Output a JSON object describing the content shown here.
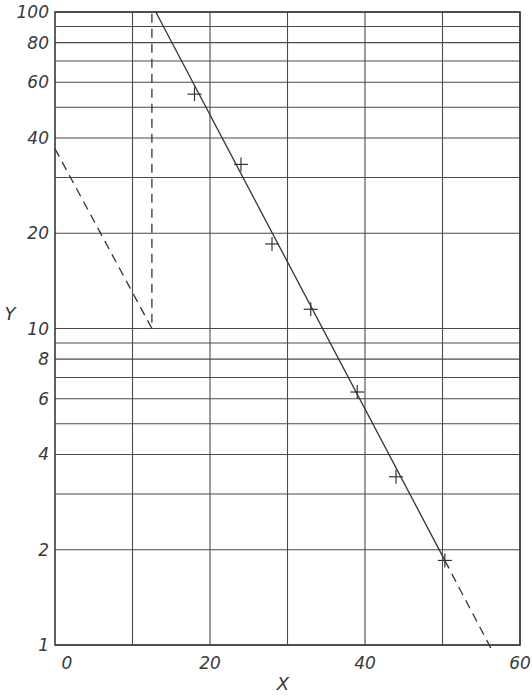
{
  "chart_data": {
    "type": "scatter",
    "title": "",
    "xlabel": "X",
    "ylabel": "Y",
    "xscale": "linear",
    "yscale": "log",
    "xlim": [
      0,
      60
    ],
    "ylim": [
      1,
      100
    ],
    "x_ticks": [
      0,
      20,
      40,
      60
    ],
    "y_ticks": [
      1,
      2,
      4,
      6,
      8,
      10,
      20,
      40,
      60,
      80,
      100
    ],
    "x_tick_labels": [
      "0",
      "20",
      "40",
      "60"
    ],
    "y_tick_labels": [
      "1",
      "2",
      "4",
      "6",
      "8",
      "10",
      "20",
      "40",
      "60",
      "80",
      "100"
    ],
    "grid": true,
    "x_gridlines": [
      10,
      20,
      30,
      40,
      50,
      60
    ],
    "y_gridlines": [
      1,
      2,
      3,
      4,
      5,
      6,
      7,
      8,
      9,
      10,
      20,
      30,
      40,
      50,
      60,
      70,
      80,
      90,
      100
    ],
    "series": [
      {
        "name": "data points",
        "marker": "plus",
        "x": [
          18,
          24,
          28,
          33,
          39,
          44,
          50.3
        ],
        "y": [
          55,
          33,
          18.5,
          11.5,
          6.3,
          3.4,
          1.85
        ]
      },
      {
        "name": "fitted line (solid)",
        "style": "solid",
        "x": [
          13,
          50.3
        ],
        "y": [
          100,
          1.85
        ]
      },
      {
        "name": "fitted line extrapolation (dashed)",
        "style": "dashed",
        "x": [
          50.3,
          56.5
        ],
        "y": [
          1.85,
          0.95
        ]
      },
      {
        "name": "construction line (dashed)",
        "style": "dashed",
        "x": [
          0,
          12.5,
          12.5
        ],
        "y": [
          37,
          10,
          100
        ]
      }
    ],
    "legend": null
  }
}
